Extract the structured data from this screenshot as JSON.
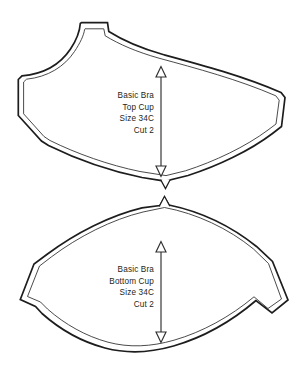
{
  "sheet": {
    "background_color": "#ffffff",
    "line_color": "#1d1d1d",
    "seam_line_color": "#2a2a2a",
    "text_color": "#231f20"
  },
  "pieces": [
    {
      "id": "top-cup",
      "name": "Basic Bra Top Cup",
      "label_lines": [
        "Basic Bra",
        "Top Cup",
        "Size 34C",
        "Cut 2"
      ],
      "grainline": {
        "orientation": "vertical",
        "double_headed": true,
        "arrowhead_style": "hollow-triangle"
      },
      "notch": {
        "position": "bottom-center",
        "direction": "down",
        "shape": "v"
      },
      "features": [
        "strap-tab",
        "concave-underarm-curve",
        "angular-side-point",
        "convex-upper-edge",
        "seam-allowance-line"
      ]
    },
    {
      "id": "bottom-cup",
      "name": "Basic Bra Bottom Cup",
      "label_lines": [
        "Basic Bra",
        "Bottom Cup",
        "Size 34C",
        "Cut 2"
      ],
      "grainline": {
        "orientation": "vertical",
        "double_headed": true,
        "arrowhead_style": "hollow-triangle"
      },
      "notch": {
        "position": "top-center",
        "direction": "up",
        "shape": "v"
      },
      "features": [
        "lens-shape",
        "sharp-left-point",
        "sharp-right-point",
        "seam-allowance-line"
      ]
    }
  ]
}
